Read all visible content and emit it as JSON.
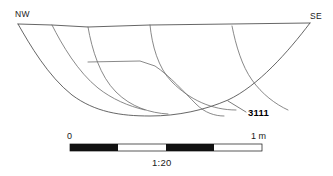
{
  "figure": {
    "type": "archaeological-section-drawing",
    "title_visible": false,
    "orientation": {
      "left_label": "NW",
      "right_label": "SE"
    },
    "context": {
      "number": "3111",
      "leader_from": [
        230,
        103
      ],
      "leader_to": [
        247,
        112
      ]
    },
    "scale_bar": {
      "start_label": "0",
      "end_label": "1 m",
      "ratio_label": "1:20",
      "segments": 4,
      "segment_pattern": [
        "dark",
        "light",
        "dark",
        "light"
      ],
      "bar_x_start": 70,
      "bar_x_end": 262,
      "bar_y": 144,
      "bar_height": 7
    },
    "colors": {
      "background": "#ffffff",
      "cut_line": "#4a4a4a",
      "fill_line": "#6b6b6b",
      "text": "#1a1a1a",
      "bar_dark": "#111111",
      "bar_light": "#ffffff"
    },
    "geometry": {
      "ground_surface": "M 18 24 L 52 25 L 88 27 L 150 25 L 230 24 L 310 23",
      "cut_profile": "M 18 24 C 30 45 48 76 72 95 C 95 112 120 116 150 116 C 178 116 205 110 228 100 C 258 86 288 52 310 23",
      "fills": [
        "M 52 25 C 62 45 78 72 98 88 C 112 99 128 106 145 110",
        "M 88 27 C 92 50 100 76 116 92 C 131 107 150 113 168 114",
        "M 88 62 L 140 61 L 155 66 C 170 76 184 92 196 104 C 205 113 215 116 224 116",
        "M 150 25 C 152 45 158 68 172 82 C 190 100 212 110 236 110",
        "M 232 26 C 236 46 242 66 252 80 C 262 94 275 104 288 110"
      ]
    }
  }
}
